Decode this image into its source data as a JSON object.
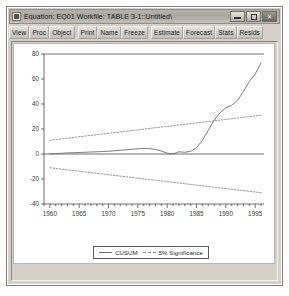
{
  "window": {
    "title": "Equation: EQ01   Workfile: TABLE 3-1::Untitled\\",
    "sysmenu_icon": "system-menu-icon",
    "controls": {
      "minimize_label": "–",
      "maximize_label": "□",
      "close_label": "✕"
    }
  },
  "toolbar": {
    "group_a": [
      {
        "label": "View"
      },
      {
        "label": "Proc"
      },
      {
        "label": "Object"
      }
    ],
    "group_b": [
      {
        "label": "Print"
      },
      {
        "label": "Name"
      },
      {
        "label": "Freeze"
      }
    ],
    "group_c": [
      {
        "label": "Estimate"
      },
      {
        "label": "Forecast"
      },
      {
        "label": "Stats"
      },
      {
        "label": "Resids"
      }
    ]
  },
  "legend": {
    "entries": [
      {
        "label": "CUSUM",
        "style": "solid",
        "color": "#6b6b6b"
      },
      {
        "label": "5% Significance",
        "style": "dashed",
        "color": "#8b8b8b"
      }
    ]
  },
  "chart_data": {
    "type": "line",
    "title": "",
    "xlabel": "",
    "ylabel": "",
    "xlim": [
      1959.0,
      1996.5
    ],
    "ylim": [
      -40,
      80
    ],
    "ytick_labels": [
      "80",
      "60",
      "40",
      "20",
      "0",
      "-20",
      "-40"
    ],
    "yticks": [
      80,
      60,
      40,
      20,
      0,
      -20,
      -40
    ],
    "xtick_labels": [
      "1960",
      "1965",
      "1970",
      "1975",
      "1980",
      "1985",
      "1990",
      "1995"
    ],
    "xticks": [
      1960,
      1965,
      1970,
      1975,
      1980,
      1985,
      1990,
      1995
    ],
    "minor_xtick_step": 1,
    "grid": false,
    "zero_line": 0,
    "legend_position": "bottom-center",
    "series": [
      {
        "name": "CUSUM",
        "style": "solid",
        "color": "#6b6b6b",
        "x": [
          1960,
          1961,
          1962,
          1963,
          1964,
          1965,
          1966,
          1967,
          1968,
          1969,
          1970,
          1971,
          1972,
          1973,
          1974,
          1975,
          1976,
          1977,
          1978,
          1979,
          1980,
          1981,
          1982,
          1983,
          1984,
          1985,
          1986,
          1987,
          1988,
          1989,
          1990,
          1991,
          1992,
          1993,
          1994,
          1995,
          1996
        ],
        "values": [
          0.0,
          0.3,
          0.6,
          0.9,
          1.0,
          1.2,
          1.4,
          1.6,
          1.8,
          2.0,
          2.2,
          2.6,
          3.0,
          3.4,
          3.8,
          4.2,
          4.4,
          4.3,
          3.6,
          2.4,
          0.7,
          0.0,
          1.8,
          1.4,
          2.2,
          5.0,
          11.0,
          19.0,
          27.0,
          33.0,
          37.0,
          39.0,
          43.0,
          50.0,
          58.0,
          64.0,
          73.0
        ]
      },
      {
        "name": "5% Significance (upper)",
        "style": "dashed",
        "color": "#8b8b8b",
        "x": [
          1960,
          1996
        ],
        "values": [
          11.0,
          31.0
        ]
      },
      {
        "name": "5% Significance (lower)",
        "style": "dashed",
        "color": "#8b8b8b",
        "x": [
          1960,
          1996
        ],
        "values": [
          -11.0,
          -31.0
        ]
      }
    ]
  }
}
